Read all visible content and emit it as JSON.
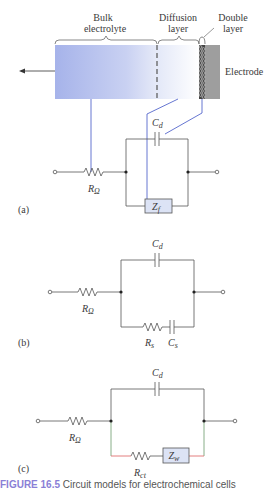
{
  "figure": {
    "panel_a": {
      "region_labels": {
        "bulk_line1": "Bulk",
        "bulk_line2": "electrolyte",
        "diffusion_line1": "Diffusion",
        "diffusion_line2": "layer",
        "double_line1": "Double",
        "double_line2": "layer",
        "electrode": "Electrode"
      },
      "components": {
        "capacitor": "C",
        "capacitor_sub": "d",
        "resistor": "R",
        "resistor_sub": "Ω",
        "impedance": "Z",
        "impedance_sub": "f"
      },
      "panel_label": "(a)"
    },
    "panel_b": {
      "components": {
        "capacitor": "C",
        "capacitor_sub": "d",
        "resistor": "R",
        "resistor_sub": "Ω",
        "series_resistor": "R",
        "series_resistor_sub": "s",
        "series_capacitor": "C",
        "series_capacitor_sub": "s"
      },
      "panel_label": "(b)"
    },
    "panel_c": {
      "components": {
        "capacitor": "C",
        "capacitor_sub": "d",
        "resistor": "R",
        "resistor_sub": "Ω",
        "charge_transfer_resistor": "R",
        "charge_transfer_resistor_sub": "ct",
        "warburg": "Z",
        "warburg_sub": "w"
      },
      "panel_label": "(c)"
    },
    "caption": {
      "figure_number": "FIGURE 16.5",
      "text": "Circuit models for electrochemical cells"
    },
    "colors": {
      "wire": "#555555",
      "bulk_gradient_start": "#a9b6ea",
      "bulk_gradient_end": "#ffffff",
      "electrode": "#9e9e9e",
      "connector_blue": "#5566cc",
      "impedance_box_fill": "#dce3f5",
      "red_wire": "#e07070",
      "green_wire": "#6a9a6a",
      "caption_accent": "#8a7fd6"
    }
  }
}
